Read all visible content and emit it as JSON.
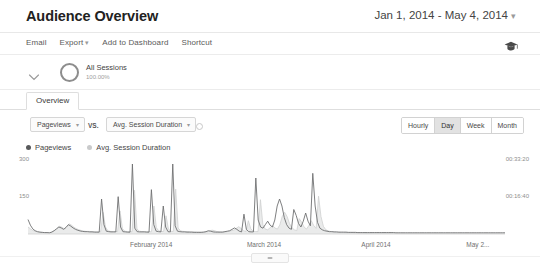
{
  "header": {
    "title": "Audience Overview",
    "date_range": "Jan 1, 2014 - May 4, 2014",
    "date_range_caret": "▾"
  },
  "toolbar": {
    "items": [
      {
        "label": "Email",
        "caret": ""
      },
      {
        "label": "Export",
        "caret": "▾"
      },
      {
        "label": "Add to Dashboard",
        "caret": ""
      },
      {
        "label": "Shortcut",
        "caret": ""
      }
    ],
    "academy_icon": "graduation-cap-icon"
  },
  "segment": {
    "expander_icon": "chevron-down-icon",
    "donut_icon": "segment-donut-icon",
    "name": "All Sessions",
    "percent": "100.00%"
  },
  "tabs": [
    {
      "label": "Overview",
      "selected": true
    }
  ],
  "metrics": {
    "primary": "Pageviews",
    "primary_caret": "▾",
    "vs_label": "VS.",
    "secondary": "Avg. Session Duration",
    "secondary_caret": "▾",
    "clear_icon": "clear-metric-icon"
  },
  "granularity": {
    "options": [
      "Hourly",
      "Day",
      "Week",
      "Month"
    ],
    "selected": "Day"
  },
  "legend": [
    {
      "label": "Pageviews",
      "color": "#58595b"
    },
    {
      "label": "Avg. Session Duration",
      "color": "#c9cacb"
    }
  ],
  "chart_data": {
    "type": "line",
    "title": "Audience Overview",
    "xlabel": "",
    "ylabel": "Pageviews",
    "grid": false,
    "legend_position": "top-left",
    "x_tick_labels": [
      "February 2014",
      "March 2014",
      "April 2014",
      "May 2..."
    ],
    "x_tick_positions_pct": [
      26.0,
      50.5,
      74.5,
      96.5
    ],
    "axes": [
      {
        "side": "left",
        "name": "Pageviews",
        "tick_labels": [
          "300",
          "150"
        ],
        "tick_values": [
          300,
          150
        ],
        "ylim": [
          0,
          330
        ]
      },
      {
        "side": "right",
        "name": "Avg. Session Duration",
        "tick_labels": [
          "00:33:20",
          "00:16:40"
        ],
        "tick_values": [
          2000,
          1000
        ],
        "ylim": [
          0,
          2200
        ]
      }
    ],
    "series": [
      {
        "name": "Pageviews",
        "axis": "left",
        "color": "#6f7072",
        "values": [
          62,
          38,
          22,
          14,
          10,
          8,
          7,
          6,
          6,
          5,
          8,
          14,
          22,
          30,
          26,
          20,
          28,
          40,
          34,
          26,
          20,
          16,
          13,
          11,
          10,
          10,
          9,
          9,
          8,
          8,
          8,
          150,
          40,
          12,
          10,
          9,
          9,
          9,
          160,
          30,
          10,
          9,
          8,
          8,
          300,
          25,
          10,
          9,
          9,
          9,
          8,
          8,
          190,
          40,
          12,
          10,
          9,
          120,
          30,
          10,
          9,
          300,
          35,
          12,
          10,
          9,
          9,
          8,
          8,
          8,
          7,
          7,
          7,
          7,
          8,
          10,
          14,
          12,
          9,
          8,
          8,
          8,
          8,
          10,
          12,
          14,
          20,
          26,
          20,
          12,
          9,
          85,
          20,
          10,
          9,
          9,
          240,
          60,
          30,
          25,
          40,
          55,
          38,
          30,
          60,
          120,
          150,
          120,
          70,
          40,
          25,
          20,
          105,
          80,
          45,
          30,
          55,
          90,
          55,
          35,
          260,
          120,
          50,
          25,
          18,
          14,
          12,
          10,
          10,
          9,
          9,
          8,
          8,
          8,
          8,
          7,
          7,
          7,
          7,
          6,
          6,
          6,
          6,
          6,
          6,
          6,
          6,
          6,
          6,
          6,
          6,
          6,
          6,
          6,
          6,
          5,
          5,
          5,
          5,
          5,
          5,
          5,
          5,
          5,
          5,
          5,
          5,
          5,
          5,
          5,
          5,
          5,
          5,
          5,
          5,
          5,
          5,
          5,
          5,
          5,
          5,
          5,
          5,
          5,
          5,
          5,
          5,
          5,
          5,
          5,
          5,
          5,
          5,
          5,
          5,
          5,
          5,
          5,
          5,
          5,
          5,
          5
        ]
      },
      {
        "name": "Avg. Session Duration",
        "axis": "right",
        "color": "#cfd0d1",
        "values": [
          200,
          150,
          100,
          80,
          60,
          50,
          45,
          40,
          40,
          35,
          60,
          100,
          160,
          220,
          190,
          150,
          210,
          290,
          250,
          190,
          150,
          120,
          100,
          85,
          75,
          75,
          70,
          70,
          60,
          60,
          60,
          620,
          200,
          90,
          75,
          70,
          70,
          70,
          660,
          150,
          80,
          70,
          65,
          65,
          1250,
          140,
          80,
          70,
          70,
          70,
          65,
          65,
          800,
          180,
          90,
          75,
          70,
          520,
          140,
          80,
          70,
          1280,
          170,
          90,
          75,
          70,
          70,
          60,
          60,
          60,
          55,
          55,
          55,
          55,
          60,
          80,
          110,
          95,
          70,
          60,
          60,
          60,
          60,
          80,
          95,
          110,
          160,
          210,
          160,
          95,
          70,
          380,
          150,
          80,
          70,
          70,
          980,
          260,
          140,
          120,
          180,
          240,
          170,
          140,
          260,
          500,
          620,
          500,
          300,
          180,
          120,
          95,
          440,
          340,
          200,
          140,
          240,
          380,
          240,
          160,
          1080,
          500,
          220,
          120,
          90,
          70,
          60,
          50,
          50,
          45,
          45,
          40,
          40,
          40,
          40,
          35,
          35,
          35,
          35,
          30,
          30,
          30,
          30,
          30,
          30,
          30,
          30,
          30,
          30,
          30,
          30,
          30,
          30,
          30,
          30,
          25,
          25,
          25,
          25,
          25,
          25,
          25,
          25,
          25,
          25,
          25,
          25,
          25,
          25,
          25,
          25,
          25,
          25,
          25,
          25,
          25,
          25,
          25,
          25,
          25,
          25,
          25,
          25,
          25,
          25,
          25,
          25,
          25,
          25,
          25,
          25,
          25,
          25,
          25,
          25,
          25,
          25,
          25
        ]
      }
    ]
  },
  "bottom": {
    "drag_handle_icon": "drag-handle-icon"
  }
}
